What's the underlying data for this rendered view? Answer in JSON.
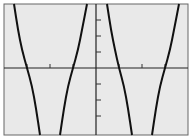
{
  "chart_data": {
    "type": "line",
    "title": "",
    "xlabel": "",
    "ylabel": "",
    "grid": false,
    "legend": null,
    "axis_ticks": {
      "x_ticks_left": 3,
      "x_ticks_right": 3,
      "y_ticks_above": 3,
      "y_ticks_below": 3
    },
    "x_intercepts_px": [
      27,
      73,
      119,
      165
    ],
    "series": [
      {
        "name": "branch-1",
        "direction": "decreasing",
        "points_px": [
          [
            14,
            4
          ],
          [
            18,
            30
          ],
          [
            22,
            50
          ],
          [
            27,
            68
          ],
          [
            32,
            86
          ],
          [
            36,
            108
          ],
          [
            40,
            135
          ]
        ]
      },
      {
        "name": "branch-2",
        "direction": "increasing",
        "points_px": [
          [
            60,
            135
          ],
          [
            64,
            108
          ],
          [
            68,
            86
          ],
          [
            73,
            68
          ],
          [
            78,
            50
          ],
          [
            82,
            30
          ],
          [
            87,
            4
          ]
        ]
      },
      {
        "name": "branch-3",
        "direction": "decreasing",
        "points_px": [
          [
            107,
            4
          ],
          [
            111,
            30
          ],
          [
            115,
            50
          ],
          [
            119,
            68
          ],
          [
            124,
            86
          ],
          [
            128,
            108
          ],
          [
            132,
            135
          ]
        ]
      },
      {
        "name": "branch-4",
        "direction": "increasing",
        "points_px": [
          [
            152,
            135
          ],
          [
            156,
            108
          ],
          [
            160,
            86
          ],
          [
            165,
            68
          ],
          [
            170,
            50
          ],
          [
            174,
            30
          ],
          [
            179,
            4
          ]
        ]
      }
    ],
    "colors": {
      "background": "#e9e9e9",
      "curve": "#111111",
      "axes": "#222222",
      "frame": "#555555"
    }
  }
}
